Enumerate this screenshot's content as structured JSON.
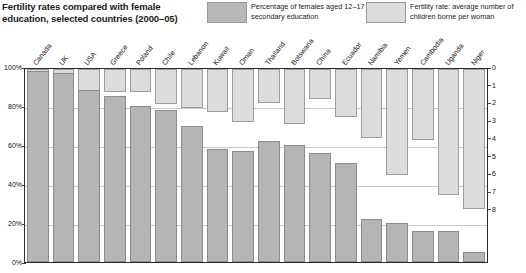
{
  "header": {
    "title": "Fertility rates compared with female education, selected countries (2000–05)",
    "legend": [
      {
        "key": "education",
        "swatch": "dark",
        "color": "#b8b8b8",
        "text": "Percentage of females aged 12–17 in secondary education"
      },
      {
        "key": "fertility",
        "swatch": "light",
        "color": "#dcdcdc",
        "text": "Fertility rate: average number of children borne per woman"
      }
    ]
  },
  "axes": {
    "left_ticks": [
      "100%",
      "80%",
      "60%",
      "40%",
      "20%",
      "0%"
    ],
    "left_values": [
      100,
      80,
      60,
      40,
      20,
      0
    ],
    "right_ticks": [
      "0",
      "1",
      "2",
      "3",
      "4",
      "5",
      "6",
      "7",
      "8"
    ],
    "right_values": [
      0,
      1,
      2,
      3,
      4,
      5,
      6,
      7,
      8
    ]
  },
  "chart_data": {
    "type": "bar",
    "title": "Fertility rates compared with female education, selected countries (2000–05)",
    "xlabel": "",
    "ylabel": "Percentage of females aged 12–17 in secondary education",
    "y2label": "Fertility rate: average number of children borne per woman",
    "ylim": [
      0,
      100
    ],
    "y2lim": [
      0,
      8
    ],
    "y2_inverted": true,
    "grid": true,
    "legend_position": "top",
    "categories": [
      "Canada",
      "UK",
      "USA",
      "Greece",
      "Poland",
      "Chile",
      "Lebanon",
      "Kuwait",
      "Oman",
      "Thailand",
      "Botswana",
      "China",
      "Ecuador",
      "Namibia",
      "Yemen",
      "Cambodia",
      "Uganda",
      "Niger"
    ],
    "series": [
      {
        "name": "Percentage of females aged 12–17 in secondary education",
        "axis": "left",
        "unit": "%",
        "color": "#b5b5b5",
        "values": [
          98,
          97,
          88,
          85,
          80,
          78,
          70,
          58,
          57,
          62,
          60,
          56,
          51,
          22,
          20,
          16,
          16,
          5
        ]
      },
      {
        "name": "Fertility rate: average number of children borne per woman",
        "axis": "right",
        "unit": "children per woman",
        "color": "#dcdcdc",
        "values": [
          1.5,
          1.7,
          2.0,
          1.3,
          1.3,
          2.0,
          2.2,
          2.4,
          3.0,
          1.9,
          3.1,
          1.7,
          2.7,
          3.9,
          6.0,
          4.0,
          7.1,
          7.9
        ]
      }
    ]
  }
}
